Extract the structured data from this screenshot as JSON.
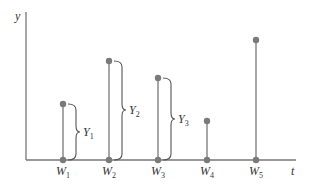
{
  "axes": {
    "y_label": "y",
    "x_label": "t"
  },
  "colors": {
    "line": "#777777",
    "dot": "#7a7a7a",
    "text": "#333333"
  },
  "points": [
    {
      "label": "W",
      "sub": "1",
      "x": 63,
      "top": 104
    },
    {
      "label": "W",
      "sub": "2",
      "x": 109,
      "top": 61
    },
    {
      "label": "W",
      "sub": "3",
      "x": 158,
      "top": 78
    },
    {
      "label": "W",
      "sub": "4",
      "x": 207,
      "top": 121
    },
    {
      "label": "W",
      "sub": "5",
      "x": 256,
      "top": 40
    }
  ],
  "braces": [
    {
      "label": "Y",
      "sub": "1"
    },
    {
      "label": "Y",
      "sub": "2"
    },
    {
      "label": "Y",
      "sub": "3"
    }
  ]
}
